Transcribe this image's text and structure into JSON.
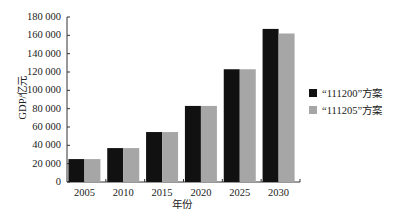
{
  "chart_data": {
    "type": "bar",
    "title": "",
    "xlabel": "年份",
    "ylabel": "GDP/亿元",
    "categories": [
      "2005",
      "2010",
      "2015",
      "2020",
      "2025",
      "2030"
    ],
    "series": [
      {
        "name": "“111200”方案",
        "color": "#111111",
        "values": [
          25000,
          37000,
          54500,
          83000,
          123000,
          167000
        ]
      },
      {
        "name": "“111205”方案",
        "color": "#a6a6a6",
        "values": [
          25000,
          37000,
          54500,
          83000,
          123000,
          162000
        ]
      }
    ],
    "ylim": [
      0,
      180000
    ],
    "yticks": [
      0,
      20000,
      40000,
      60000,
      80000,
      100000,
      120000,
      140000,
      160000,
      180000
    ],
    "ytick_labels": [
      "0",
      "20 000",
      "40 000",
      "60 000",
      "80 000",
      "100 000",
      "120 000",
      "140 000",
      "160 000",
      "180 000"
    ],
    "grid": false,
    "legend_position": "right"
  }
}
